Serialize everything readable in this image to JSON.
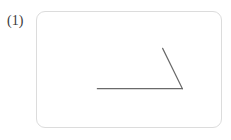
{
  "page": {
    "background_color": "#ffffff",
    "width": 231,
    "height": 140
  },
  "item": {
    "label": "(1)",
    "label_color": "#3a3a3a"
  },
  "figure_card": {
    "x": 36,
    "y": 11,
    "width": 186,
    "height": 117,
    "corner_radius": 9,
    "border_color": "#dcdcdc",
    "background_color": "#ffffff"
  },
  "figure": {
    "type": "angle",
    "stroke_color": "#6a6a6a",
    "stroke_width": 1.2,
    "vertex": {
      "x": 147,
      "y": 78
    },
    "rays": [
      {
        "name": "horizontal-ray",
        "from": {
          "x": 147,
          "y": 78
        },
        "to": {
          "x": 61,
          "y": 78
        }
      },
      {
        "name": "diagonal-ray",
        "from": {
          "x": 147,
          "y": 78
        },
        "to": {
          "x": 127,
          "y": 37
        }
      }
    ]
  }
}
